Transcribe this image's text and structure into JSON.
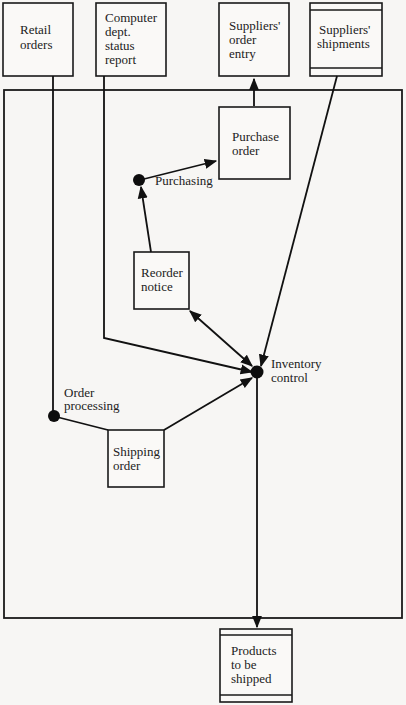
{
  "diagram": {
    "title": "",
    "boxes": {
      "retail_orders": {
        "lines": [
          "Retail",
          "orders"
        ]
      },
      "computer_dept": {
        "lines": [
          "Computer",
          "dept.",
          "status",
          "report"
        ]
      },
      "suppliers_order_entry": {
        "lines": [
          "Suppliers'",
          "order",
          "entry"
        ]
      },
      "suppliers_shipments": {
        "lines": [
          "Suppliers'",
          "shipments"
        ]
      },
      "purchase_order": {
        "lines": [
          "Purchase",
          "order"
        ]
      },
      "reorder_notice": {
        "lines": [
          "Reorder",
          "notice"
        ]
      },
      "shipping_order": {
        "lines": [
          "Shipping",
          "order"
        ]
      },
      "products_to_be_shipped": {
        "lines": [
          "Products",
          "to be",
          "shipped"
        ]
      }
    },
    "nodes": {
      "purchasing": {
        "lines": [
          "Purchasing"
        ]
      },
      "inventory_control": {
        "lines": [
          "Inventory",
          "control"
        ]
      },
      "order_processing": {
        "lines": [
          "Order",
          "processing"
        ]
      }
    },
    "edges": [
      {
        "from": "retail_orders",
        "to": "order_processing"
      },
      {
        "from": "computer_dept",
        "to": "inventory_control"
      },
      {
        "from": "purchase_order",
        "to": "suppliers_order_entry"
      },
      {
        "from": "suppliers_shipments",
        "to": "inventory_control"
      },
      {
        "from": "purchasing",
        "to": "purchase_order"
      },
      {
        "from": "reorder_notice",
        "to": "purchasing"
      },
      {
        "from": "reorder_notice",
        "to": "inventory_control",
        "bidirectional": true
      },
      {
        "from": "order_processing",
        "to": "shipping_order"
      },
      {
        "from": "shipping_order",
        "to": "inventory_control"
      },
      {
        "from": "inventory_control",
        "to": "products_to_be_shipped"
      }
    ]
  }
}
